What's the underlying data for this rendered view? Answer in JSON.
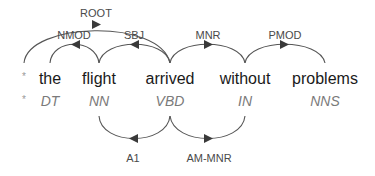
{
  "root_marker": {
    "word": "*",
    "pos": "*"
  },
  "tokens": [
    {
      "word": "the",
      "pos": "DT",
      "x": 50
    },
    {
      "word": "flight",
      "pos": "NN",
      "x": 99
    },
    {
      "word": "arrived",
      "pos": "VBD",
      "x": 170
    },
    {
      "word": "without",
      "pos": "IN",
      "x": 245
    },
    {
      "word": "problems",
      "pos": "NNS",
      "x": 325
    }
  ],
  "syntactic_arcs": [
    {
      "label": "ROOT",
      "from": "*",
      "to": "arrived",
      "arrow_direction": "right"
    },
    {
      "label": "NMOD",
      "from": "flight",
      "to": "the",
      "arrow_direction": "left"
    },
    {
      "label": "SBJ",
      "from": "arrived",
      "to": "flight",
      "arrow_direction": "left"
    },
    {
      "label": "MNR",
      "from": "arrived",
      "to": "without",
      "arrow_direction": "right"
    },
    {
      "label": "PMOD",
      "from": "without",
      "to": "problems",
      "arrow_direction": "right"
    }
  ],
  "semantic_arcs": [
    {
      "label": "A1",
      "from": "arrived",
      "to": "flight",
      "arrow_direction": "left"
    },
    {
      "label": "AM-MNR",
      "from": "arrived",
      "to": "without",
      "arrow_direction": "right"
    }
  ],
  "colors": {
    "arc": "#555555",
    "word": "#1a1a1a",
    "pos": "#7a7a7a",
    "label": "#4a4a4a"
  }
}
